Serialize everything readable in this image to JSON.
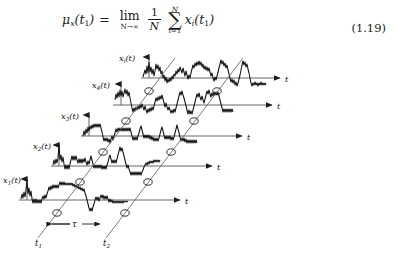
{
  "document": {
    "kind": "textbook-page-excerpt",
    "background_color": "#ffffff",
    "ink_color": "#1a1a1a"
  },
  "equation": {
    "number": "(1.19)",
    "lhs": "μ",
    "lhs_sub": "x",
    "lhs_arg_open": "(",
    "lhs_arg": "t",
    "lhs_arg_sub": "1",
    "lhs_arg_close": ")",
    "equals": "=",
    "limit_op": "lim",
    "limit_sub": "N→∞",
    "fraction_numerator": "1",
    "fraction_denominator": "N",
    "sum_symbol": "∑",
    "sum_upper": "N",
    "sum_lower": "i=1",
    "term": "x",
    "term_sub": "i",
    "term_arg_open": "(",
    "term_arg": "t",
    "term_arg_sub": "1",
    "term_arg_close": ")",
    "plain_text": "μ_x(t_1) = lim_{N→∞} (1/N) Σ_{i=1}^{N} x_i(t_1)"
  },
  "figure": {
    "caption": "",
    "time_axis_label": "t",
    "tau_label": "τ",
    "tick_t1": "t",
    "tick_t1_sub": "1",
    "tick_t2": "t",
    "tick_t2_sub": "2",
    "traces": [
      {
        "id": "trace-x1",
        "label_base": "x",
        "label_sub": "1",
        "label_suffix": "(t)",
        "label_full": "x1(t)"
      },
      {
        "id": "trace-x2",
        "label_base": "x",
        "label_sub": "2",
        "label_suffix": "(t)",
        "label_full": "x2(t)"
      },
      {
        "id": "trace-x3",
        "label_base": "x",
        "label_sub": "3",
        "label_suffix": "(t)",
        "label_full": "x3(t)"
      },
      {
        "id": "trace-x4",
        "label_base": "x",
        "label_sub": "4",
        "label_suffix": "(t)",
        "label_full": "x4(t)"
      },
      {
        "id": "trace-xi",
        "label_base": "x",
        "label_sub": "i",
        "label_suffix": "(t)",
        "label_full": "xi(t)"
      }
    ]
  }
}
